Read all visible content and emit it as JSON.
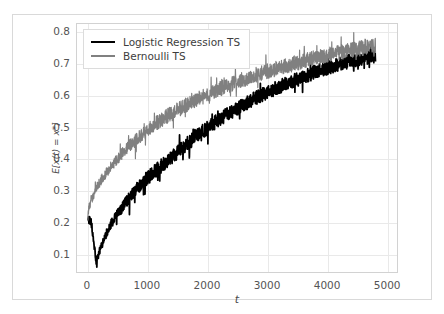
{
  "chart_data": {
    "type": "line",
    "title": "",
    "xlabel": "t",
    "ylabel": "E[x(t) = x*]",
    "xlim": [
      -180,
      5180
    ],
    "ylim": [
      0.04,
      0.825
    ],
    "xticks": [
      0,
      1000,
      2000,
      3000,
      4000,
      5000
    ],
    "xtick_labels": [
      "0",
      "1000",
      "2000",
      "3000",
      "4000",
      "5000"
    ],
    "yticks": [
      0.1,
      0.2,
      0.3,
      0.4,
      0.5,
      0.6,
      0.7,
      0.8
    ],
    "ytick_labels": [
      "0.1",
      "0.2",
      "0.3",
      "0.4",
      "0.5",
      "0.6",
      "0.7",
      "0.8"
    ],
    "grid": true,
    "legend_position": "upper left",
    "series": [
      {
        "name": "Logistic Regression TS",
        "color": "#000000",
        "linewidth": 1.8,
        "x": [
          0,
          60,
          120,
          150,
          200,
          260,
          320,
          400,
          500,
          600,
          700,
          800,
          900,
          1000,
          1100,
          1200,
          1300,
          1400,
          1500,
          1600,
          1700,
          1800,
          1900,
          2000,
          2100,
          2200,
          2300,
          2400,
          2500,
          2600,
          2700,
          2800,
          2900,
          3000,
          3100,
          3200,
          3300,
          3400,
          3500,
          3600,
          3700,
          3800,
          3900,
          4000,
          4100,
          4200,
          4300,
          4400,
          4500,
          4600,
          4700,
          4800,
          4900,
          5000
        ],
        "values": [
          0.212,
          0.198,
          0.105,
          0.068,
          0.108,
          0.142,
          0.168,
          0.196,
          0.224,
          0.252,
          0.276,
          0.3,
          0.32,
          0.338,
          0.356,
          0.372,
          0.388,
          0.404,
          0.42,
          0.436,
          0.452,
          0.468,
          0.482,
          0.496,
          0.51,
          0.523,
          0.535,
          0.547,
          0.558,
          0.569,
          0.58,
          0.59,
          0.599,
          0.608,
          0.617,
          0.626,
          0.634,
          0.642,
          0.65,
          0.658,
          0.665,
          0.672,
          0.679,
          0.686,
          0.692,
          0.698,
          0.703,
          0.708,
          0.713,
          0.717,
          0.721,
          0.724,
          0.727,
          0.73
        ],
        "noise": 0.022
      },
      {
        "name": "Bernoulli TS",
        "color": "#808080",
        "linewidth": 1.2,
        "x": [
          0,
          60,
          120,
          180,
          240,
          300,
          400,
          500,
          600,
          700,
          800,
          900,
          1000,
          1100,
          1200,
          1300,
          1400,
          1500,
          1600,
          1700,
          1800,
          1900,
          2000,
          2100,
          2200,
          2300,
          2400,
          2500,
          2600,
          2700,
          2800,
          2900,
          3000,
          3100,
          3200,
          3300,
          3400,
          3500,
          3600,
          3700,
          3800,
          3900,
          4000,
          4100,
          4200,
          4300,
          4400,
          4500,
          4600,
          4700,
          4800,
          4900,
          5000
        ],
        "values": [
          0.232,
          0.268,
          0.296,
          0.318,
          0.336,
          0.352,
          0.378,
          0.4,
          0.42,
          0.44,
          0.458,
          0.474,
          0.49,
          0.504,
          0.517,
          0.53,
          0.542,
          0.553,
          0.564,
          0.574,
          0.584,
          0.593,
          0.602,
          0.611,
          0.619,
          0.627,
          0.635,
          0.642,
          0.649,
          0.656,
          0.663,
          0.669,
          0.675,
          0.681,
          0.687,
          0.692,
          0.697,
          0.702,
          0.707,
          0.712,
          0.717,
          0.721,
          0.726,
          0.73,
          0.734,
          0.738,
          0.742,
          0.746,
          0.749,
          0.752,
          0.755,
          0.758,
          0.761
        ],
        "noise": 0.024
      }
    ]
  }
}
